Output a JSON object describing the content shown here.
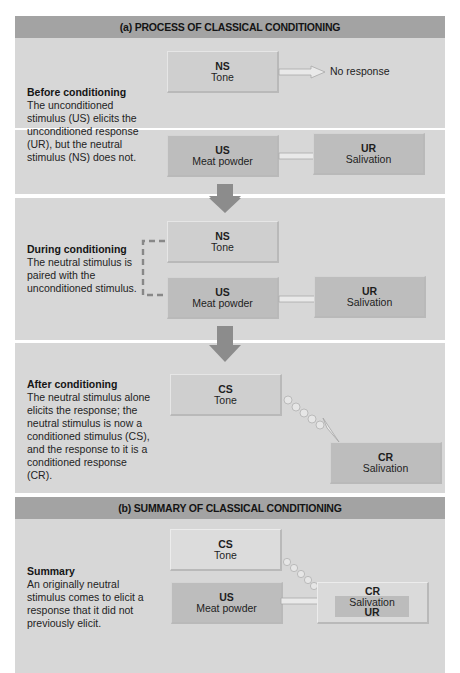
{
  "section_a": {
    "title": "(a) PROCESS OF CLASSICAL CONDITIONING",
    "before": {
      "heading": "Before conditioning",
      "body": "The unconditioned stimulus (US) elicits the unconditioned response (UR), but the neutral stimulus (NS) does not.",
      "ns_box": {
        "abbr": "NS",
        "label": "Tone"
      },
      "ns_result": "No response",
      "us_box": {
        "abbr": "US",
        "label": "Meat powder"
      },
      "ur_box": {
        "abbr": "UR",
        "label": "Salivation"
      }
    },
    "during": {
      "heading": "During conditioning",
      "body": "The neutral stimulus is paired with the unconditioned stimulus.",
      "ns_box": {
        "abbr": "NS",
        "label": "Tone"
      },
      "us_box": {
        "abbr": "US",
        "label": "Meat powder"
      },
      "ur_box": {
        "abbr": "UR",
        "label": "Salivation"
      }
    },
    "after": {
      "heading": "After conditioning",
      "body": "The neutral stimulus alone elicits the response; the neutral stimulus is now a conditioned stimulus (CS), and the response to it is a conditioned response (CR).",
      "cs_box": {
        "abbr": "CS",
        "label": "Tone"
      },
      "cr_box": {
        "abbr": "CR",
        "label": "Salivation"
      }
    }
  },
  "section_b": {
    "title": "(b) SUMMARY OF CLASSICAL CONDITIONING",
    "summary": {
      "heading": "Summary",
      "body": "An originally neutral stimulus comes to elicit a response that it did not previously elicit.",
      "cs_box": {
        "abbr": "CS",
        "label": "Tone"
      },
      "us_box": {
        "abbr": "US",
        "label": "Meat powder"
      },
      "cr_box": {
        "abbr": "CR",
        "label": "Salivation",
        "sub": "UR"
      }
    }
  },
  "colors": {
    "header_band": "#a3a3a3",
    "panel_bg": "#d7d7d7",
    "box_light": "#cfcfcf",
    "box_dark": "#bdbdbd",
    "down_arrow": "#8c8c8c"
  }
}
